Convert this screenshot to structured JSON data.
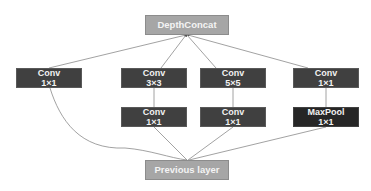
{
  "diagram": {
    "top_node": {
      "label": "DepthConcat"
    },
    "bottom_node": {
      "label": "Previous layer"
    },
    "columns": [
      {
        "upper": {
          "op": "Conv",
          "size": "1×1"
        }
      },
      {
        "upper": {
          "op": "Conv",
          "size": "3×3"
        },
        "lower": {
          "op": "Conv",
          "size": "1×1"
        }
      },
      {
        "upper": {
          "op": "Conv",
          "size": "5×5"
        },
        "lower": {
          "op": "Conv",
          "size": "1×1"
        }
      },
      {
        "upper": {
          "op": "Conv",
          "size": "1×1"
        },
        "lower": {
          "op": "MaxPool",
          "size": "1×1"
        }
      }
    ],
    "colors": {
      "light_node": "#a6a6a6",
      "conv_node": "#404040",
      "pool_node": "#262626",
      "edge": "#8a8a8a"
    }
  }
}
